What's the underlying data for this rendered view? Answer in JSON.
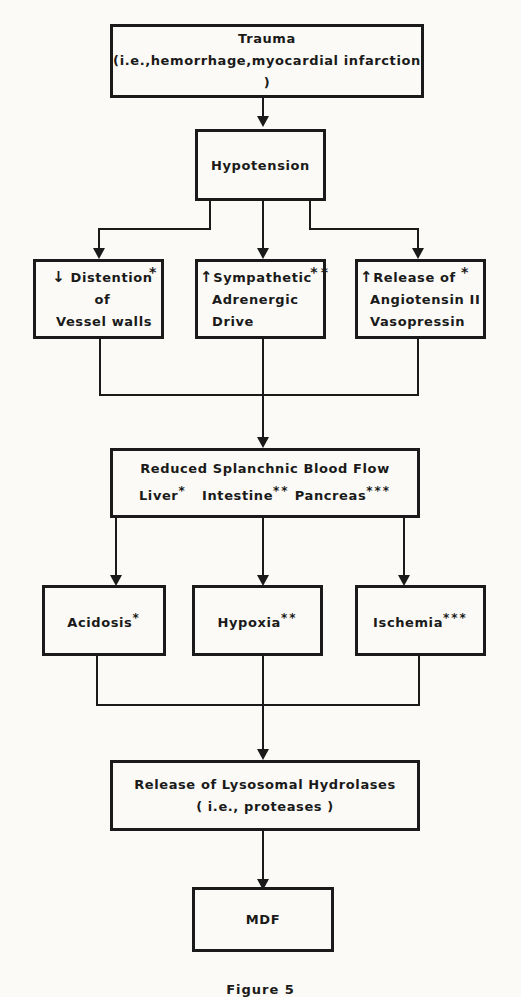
{
  "diagram": {
    "trauma": {
      "title": "Trauma",
      "subtitle": "(i.e.,hemorrhage,myocardial infarction )"
    },
    "hypotension": {
      "title": "Hypotension"
    },
    "branch1": [
      {
        "arrow_glyph": "↓",
        "arrow_meaning": "decrease",
        "line1": "Distention of",
        "line2": "Vessel walls",
        "marker": "*"
      },
      {
        "arrow_glyph": "↑",
        "arrow_meaning": "increase",
        "line1": "Sympathetic",
        "line2": "Adrenergic",
        "line3": "Drive",
        "marker": "**"
      },
      {
        "arrow_glyph": "↑",
        "arrow_meaning": "increase",
        "line1": "Release of",
        "line2": "Angiotensin II",
        "line3": "Vasopressin",
        "marker": "*"
      }
    ],
    "splanchnic": {
      "title": "Reduced Splanchnic Blood Flow",
      "organs": [
        {
          "label": "Liver",
          "marker": "*"
        },
        {
          "label": "Intestine",
          "marker": "**"
        },
        {
          "label": "Pancreas",
          "marker": "***"
        }
      ]
    },
    "branch2": [
      {
        "label": "Acidosis",
        "marker": "*"
      },
      {
        "label": "Hypoxia",
        "marker": "**"
      },
      {
        "label": "Ischemia",
        "marker": "***"
      }
    ],
    "hydrolases": {
      "title": "Release of Lysosomal Hydrolases",
      "subtitle": "( i.e., proteases )"
    },
    "mdf": {
      "title": "MDF"
    },
    "caption": "Figure 5"
  },
  "colors": {
    "ink": "#1a1a1a",
    "paper": "#fbfaf6"
  }
}
